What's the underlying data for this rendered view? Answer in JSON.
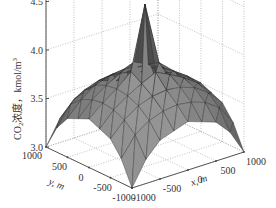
{
  "chart_data": {
    "type": "surface3d",
    "title": "",
    "xlabel": "x, m",
    "ylabel": "y, m",
    "zlabel": "CO2浓度, kmol/m3",
    "zlabel_parts": {
      "prefix": "CO",
      "sub": "2",
      "mid": "浓度，kmol/m",
      "sup": "3"
    },
    "xlim": [
      -1000,
      1000
    ],
    "ylim": [
      -1000,
      1000
    ],
    "zlim": [
      3.0,
      5.0
    ],
    "x_ticks": [
      "-1000",
      "-500",
      "0",
      "500",
      "1000"
    ],
    "y_ticks": [
      "1000",
      "500",
      "0",
      "-500",
      "-1000"
    ],
    "z_ticks": [
      "3.0",
      "3.5",
      "4.0",
      "4.5",
      "5.0"
    ],
    "grid": true,
    "surface": {
      "description": "Triangulated mesh surface, gray shading; sharp peak ~4.5 at center (0,0), plateau ~3.6-3.8, dropping to ~3.0 at the four corners",
      "peak": {
        "x": 0,
        "y": 0,
        "z": 4.5
      },
      "corner_value": 3.0,
      "grid_x": [
        -1000,
        -750,
        -500,
        -250,
        0,
        250,
        500,
        750,
        1000
      ],
      "grid_y": [
        -1000,
        -750,
        -500,
        -250,
        0,
        250,
        500,
        750,
        1000
      ],
      "z": [
        [
          3.0,
          3.25,
          3.4,
          3.45,
          3.5,
          3.45,
          3.4,
          3.25,
          3.0
        ],
        [
          3.25,
          3.45,
          3.55,
          3.6,
          3.62,
          3.6,
          3.55,
          3.45,
          3.25
        ],
        [
          3.4,
          3.55,
          3.65,
          3.7,
          3.72,
          3.7,
          3.65,
          3.55,
          3.4
        ],
        [
          3.45,
          3.6,
          3.7,
          3.78,
          3.85,
          3.78,
          3.7,
          3.6,
          3.45
        ],
        [
          3.5,
          3.62,
          3.72,
          3.85,
          4.5,
          3.85,
          3.72,
          3.62,
          3.5
        ],
        [
          3.45,
          3.6,
          3.7,
          3.78,
          3.85,
          3.78,
          3.7,
          3.6,
          3.45
        ],
        [
          3.4,
          3.55,
          3.65,
          3.7,
          3.72,
          3.7,
          3.65,
          3.55,
          3.4
        ],
        [
          3.25,
          3.45,
          3.55,
          3.6,
          3.62,
          3.6,
          3.55,
          3.45,
          3.25
        ],
        [
          3.0,
          3.25,
          3.4,
          3.45,
          3.5,
          3.45,
          3.4,
          3.25,
          3.0
        ]
      ]
    }
  }
}
